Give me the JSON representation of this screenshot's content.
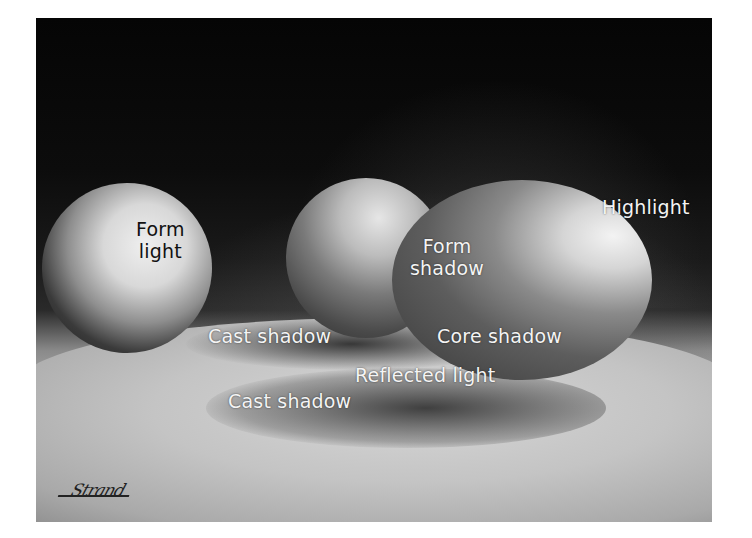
{
  "artwork": {
    "subject": "Pastel still life of three eggs on a table illustrating light and shadow",
    "signature": "Strand",
    "labels": {
      "form_light_line1": "Form",
      "form_light_line2": "light",
      "form_shadow_line1": "Form",
      "form_shadow_line2": "shadow",
      "highlight": "Highlight",
      "cast_shadow_upper": "Cast shadow",
      "core_shadow": "Core shadow",
      "reflected_light": "Reflected light",
      "cast_shadow_lower": "Cast shadow"
    }
  }
}
